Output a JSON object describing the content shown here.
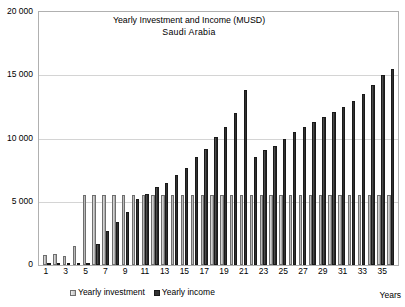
{
  "chart_data": {
    "type": "bar",
    "title": "Yearly Investment and Income  (MUSD)",
    "subtitle": "Saudi Arabia",
    "xlabel": "Years",
    "ylabel": "",
    "ylim": [
      0,
      20000
    ],
    "yticks": [
      0,
      5000,
      10000,
      15000,
      20000
    ],
    "ytick_labels": [
      "0",
      "5 000",
      "10 000",
      "15 000",
      "20 000"
    ],
    "grid": true,
    "legend_position": "bottom",
    "categories": [
      1,
      2,
      3,
      4,
      5,
      6,
      7,
      8,
      9,
      10,
      11,
      12,
      13,
      14,
      15,
      16,
      17,
      18,
      19,
      20,
      21,
      22,
      23,
      24,
      25,
      26,
      27,
      28,
      29,
      30,
      31,
      32,
      33,
      34,
      35,
      36
    ],
    "xtick_labels": [
      "1",
      "3",
      "5",
      "7",
      "9",
      "11",
      "13",
      "15",
      "17",
      "19",
      "21",
      "23",
      "25",
      "27",
      "29",
      "31",
      "33",
      "35"
    ],
    "series": [
      {
        "name": "Yearly investment",
        "color": "#bdbdbd",
        "values": [
          800,
          900,
          700,
          1500,
          5500,
          5500,
          5500,
          5500,
          5500,
          5500,
          5500,
          5500,
          5500,
          5500,
          5500,
          5500,
          5500,
          5500,
          5500,
          5500,
          5500,
          5500,
          5500,
          5500,
          5500,
          5500,
          5500,
          5500,
          5500,
          5500,
          5500,
          5500,
          5500,
          5500,
          5500,
          5500
        ]
      },
      {
        "name": "Yearly income",
        "color": "#333333",
        "values": [
          0,
          0,
          0,
          0,
          0,
          1700,
          2700,
          3400,
          4200,
          5200,
          5600,
          6200,
          6500,
          7100,
          7700,
          8500,
          9200,
          10100,
          10900,
          12000,
          13800,
          8500,
          9100,
          9400,
          10000,
          10500,
          10900,
          11300,
          11700,
          12100,
          12500,
          13000,
          13500,
          14200,
          15000,
          15500
        ]
      }
    ]
  },
  "legend": {
    "items": [
      {
        "label": "Yearly investment"
      },
      {
        "label": "Yearly income"
      }
    ]
  }
}
